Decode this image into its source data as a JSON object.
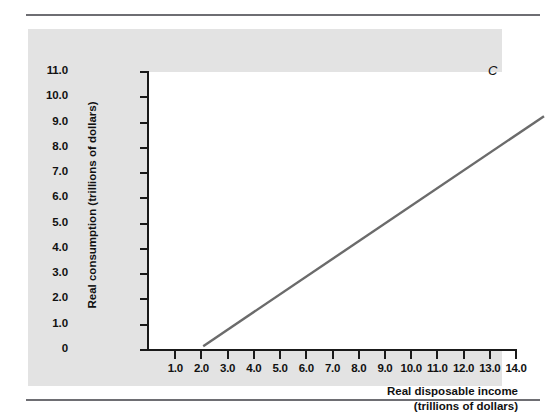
{
  "figure": {
    "background_color": "#ffffff",
    "panel_color": "#e3e3e3",
    "plot_color": "#ffffff",
    "rule_color": "#6e6e73",
    "axis_color": "#1a1a1a",
    "line_color": "#6b6b6b",
    "curve_label": "C"
  },
  "chart_data": {
    "type": "line",
    "title": "",
    "subtitle": "",
    "xlabel": "Real disposable income (trillions of dollars)",
    "xlabel_line1": "Real disposable income",
    "xlabel_line2": "(trillions of dollars)",
    "ylabel": "Real consumption (trillions of dollars)",
    "xlim": [
      0,
      14.0
    ],
    "ylim": [
      0,
      11.0
    ],
    "x_ticks": [
      1.0,
      2.0,
      3.0,
      4.0,
      5.0,
      6.0,
      7.0,
      8.0,
      9.0,
      10.0,
      11.0,
      12.0,
      13.0,
      14.0
    ],
    "x_tick_labels": [
      "1.0",
      "2.0",
      "3.0",
      "4.0",
      "5.0",
      "6.0",
      "7.0",
      "8.0",
      "9.0",
      "10.0",
      "11.0",
      "12.0",
      "13.0",
      "14.0"
    ],
    "y_ticks": [
      0,
      1.0,
      2.0,
      3.0,
      4.0,
      5.0,
      6.0,
      7.0,
      8.0,
      9.0,
      10.0,
      11.0
    ],
    "y_tick_labels": [
      "0",
      "1.0",
      "2.0",
      "3.0",
      "4.0",
      "5.0",
      "6.0",
      "7.0",
      "8.0",
      "9.0",
      "10.0",
      "11.0"
    ],
    "grid": false,
    "legend": false,
    "series": [
      {
        "name": "C",
        "annotation": "C",
        "color": "#6b6b6b",
        "x": [
          1.0,
          14.0
        ],
        "values": [
          1.3,
          10.4
        ]
      }
    ]
  }
}
